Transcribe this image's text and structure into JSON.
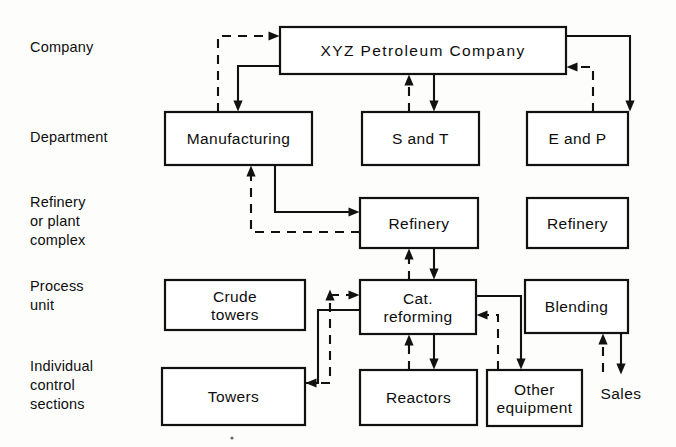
{
  "diagram": {
    "row_labels": [
      {
        "id": "company",
        "lines": [
          "Company"
        ],
        "x": 30,
        "y": 52
      },
      {
        "id": "department",
        "lines": [
          "Department"
        ],
        "x": 30,
        "y": 142
      },
      {
        "id": "refinery-or-plant-complex",
        "lines": [
          "Refinery",
          "or plant",
          "complex"
        ],
        "x": 30,
        "y": 207
      },
      {
        "id": "process-unit",
        "lines": [
          "Process",
          "unit"
        ],
        "x": 30,
        "y": 291
      },
      {
        "id": "individual-control-sections",
        "lines": [
          "Individual",
          "control",
          "sections"
        ],
        "x": 30,
        "y": 371
      }
    ],
    "boxes": [
      {
        "id": "xyz-petroleum-company",
        "label": "XYZ Petroleum Company",
        "x": 280,
        "y": 27,
        "w": 286,
        "h": 47,
        "lines": [
          "XYZ  Petroleum  Company"
        ],
        "wide": true
      },
      {
        "id": "manufacturing",
        "label": "Manufacturing",
        "x": 165,
        "y": 112,
        "w": 147,
        "h": 53,
        "lines": [
          "Manufacturing"
        ],
        "wide": false
      },
      {
        "id": "s-and-t",
        "label": "S and T",
        "x": 362,
        "y": 112,
        "w": 117,
        "h": 53,
        "lines": [
          "S and T"
        ],
        "wide": false
      },
      {
        "id": "e-and-p",
        "label": "E and P",
        "x": 527,
        "y": 112,
        "w": 101,
        "h": 53,
        "lines": [
          "E and P"
        ],
        "wide": false
      },
      {
        "id": "refinery-left",
        "label": "Refinery",
        "x": 360,
        "y": 198,
        "w": 118,
        "h": 50,
        "lines": [
          "Refinery"
        ],
        "wide": false
      },
      {
        "id": "refinery-right",
        "label": "Refinery",
        "x": 527,
        "y": 198,
        "w": 101,
        "h": 50,
        "lines": [
          "Refinery"
        ],
        "wide": false
      },
      {
        "id": "crude-towers",
        "label": "Crude towers",
        "x": 165,
        "y": 280,
        "w": 140,
        "h": 50,
        "lines": [
          "Crude",
          "towers"
        ],
        "wide": false
      },
      {
        "id": "cat-reforming",
        "label": "Cat. reforming",
        "x": 360,
        "y": 280,
        "w": 116,
        "h": 54,
        "lines": [
          "Cat.",
          "reforming"
        ],
        "wide": false
      },
      {
        "id": "blending",
        "label": "Blending",
        "x": 525,
        "y": 280,
        "w": 103,
        "h": 53,
        "lines": [
          "Blending"
        ],
        "wide": false
      },
      {
        "id": "towers",
        "label": "Towers",
        "x": 162,
        "y": 368,
        "w": 143,
        "h": 57,
        "lines": [
          "Towers"
        ],
        "wide": false
      },
      {
        "id": "reactors",
        "label": "Reactors",
        "x": 360,
        "y": 370,
        "w": 117,
        "h": 55,
        "lines": [
          "Reactors"
        ],
        "wide": false
      },
      {
        "id": "other-equipment",
        "label": "Other equipment",
        "x": 487,
        "y": 370,
        "w": 95,
        "h": 56,
        "lines": [
          "Other",
          "equipment"
        ],
        "wide": false
      }
    ],
    "free_labels": [
      {
        "id": "sales",
        "text": "Sales",
        "x": 621,
        "y": 399
      }
    ],
    "connections": [
      {
        "id": "manufacturing-up-to-company",
        "style": "dashed",
        "arrow": "end",
        "points": "218,112 218,36 274,36"
      },
      {
        "id": "company-down-to-manufacturing",
        "style": "solid",
        "arrow": "end",
        "points": "280,66 238,66 238,106"
      },
      {
        "id": "s-and-t-up-to-company",
        "style": "dashed",
        "arrow": "end",
        "points": "409,112 409,80"
      },
      {
        "id": "company-down-to-s-and-t",
        "style": "solid",
        "arrow": "end",
        "points": "434,74 434,106"
      },
      {
        "id": "company-down-to-e-and-p",
        "style": "solid",
        "arrow": "end",
        "points": "566,36 630,36 630,106"
      },
      {
        "id": "e-and-p-up-to-company",
        "style": "dashed",
        "arrow": "end",
        "points": "593,112 593,67 572,67"
      },
      {
        "id": "manufacturing-down-to-refinery",
        "style": "solid",
        "arrow": "end",
        "points": "275,165 275,212 354,212"
      },
      {
        "id": "refinery-up-to-manufacturing",
        "style": "dashed",
        "arrow": "end",
        "points": "360,232 251,232 251,171"
      },
      {
        "id": "refinery-up-dashed-from-cat",
        "style": "dashed",
        "arrow": "end",
        "points": "409,280 409,254"
      },
      {
        "id": "refinery-down-to-cat-reforming",
        "style": "solid",
        "arrow": "end",
        "points": "434,248 434,274"
      },
      {
        "id": "crude-towers-to-cat-reforming",
        "style": "dashed",
        "arrow": "end",
        "points": "330,295 354,295"
      },
      {
        "id": "cat-reforming-to-towers",
        "style": "solid",
        "arrow": "end",
        "points": "360,310 318,310 318,383 311,383"
      },
      {
        "id": "towers-up-to-cat-reforming",
        "style": "dashed",
        "arrow": "end",
        "points": "305,383 330,383 330,295"
      },
      {
        "id": "reactors-up-to-cat-reforming",
        "style": "dashed",
        "arrow": "end",
        "points": "409,370 409,340"
      },
      {
        "id": "cat-reforming-down-to-reactors",
        "style": "solid",
        "arrow": "end",
        "points": "434,334 434,364"
      },
      {
        "id": "cat-reforming-to-other-equipment",
        "style": "solid",
        "arrow": "end",
        "points": "476,296 521,296 521,364"
      },
      {
        "id": "other-equipment-to-cat-reforming",
        "style": "dashed",
        "arrow": "end",
        "points": "498,370 498,315 482,315"
      },
      {
        "id": "blending-down-to-sales",
        "style": "solid",
        "arrow": "end",
        "points": "621,333 621,369"
      },
      {
        "id": "sales-up-to-blending",
        "style": "dashed",
        "arrow": "end",
        "points": "603,372 603,339"
      }
    ],
    "colors": {
      "ink": "#111111",
      "paper": "#fdfdfc"
    }
  }
}
